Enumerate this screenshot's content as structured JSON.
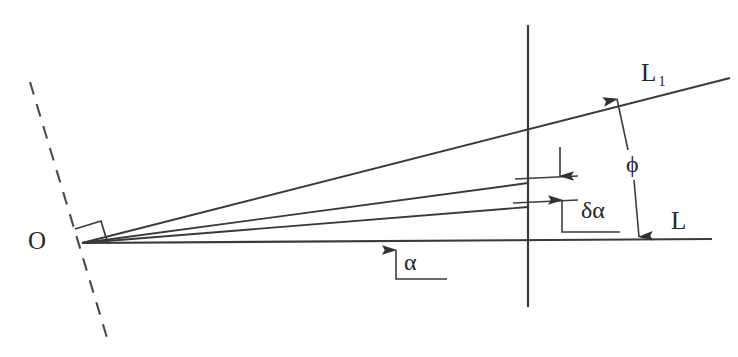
{
  "figure": {
    "background_color": "#ffffff",
    "line_color": "#3a3a3c",
    "text_color": "#262628",
    "width": 738,
    "height": 357
  },
  "labels": {
    "origin": "O",
    "ray_upper": "L",
    "ray_upper_subscript": "1",
    "ray_base": "L",
    "angle_phi": "ϕ",
    "angle_delta_alpha": "δα",
    "angle_alpha": "α"
  },
  "geometry": {
    "origin_point": [
      82,
      243
    ],
    "vertical_line": {
      "x": 528,
      "y_top": 25,
      "y_bottom": 307
    },
    "dashed_normal": {
      "x1": 30,
      "y1": 82,
      "x2": 108,
      "y2": 341
    },
    "right_angle_marker": true,
    "rays": [
      {
        "name": "L",
        "from": [
          82,
          243
        ],
        "to": [
          712,
          239
        ],
        "label": "L"
      },
      {
        "name": "ray-delta-lower",
        "from": [
          82,
          243
        ],
        "to": [
          528,
          207
        ],
        "label": ""
      },
      {
        "name": "ray-delta-upper",
        "from": [
          82,
          243
        ],
        "to": [
          528,
          183
        ],
        "label": ""
      },
      {
        "name": "L1",
        "from": [
          82,
          243
        ],
        "to": [
          730,
          78
        ],
        "label": "L1"
      }
    ]
  },
  "annotations": [
    {
      "name": "alpha",
      "text": "α",
      "type": "single-arrow-up",
      "measures": "angle between ray L and lower rays"
    },
    {
      "name": "delta-alpha",
      "text": "δα",
      "type": "double-arrow-vertical",
      "measures": "angular separation between the two adjacent rays"
    },
    {
      "name": "phi",
      "text": "ϕ",
      "type": "double-arrow-vertical",
      "measures": "angle between ray L1 and reference line L"
    }
  ]
}
